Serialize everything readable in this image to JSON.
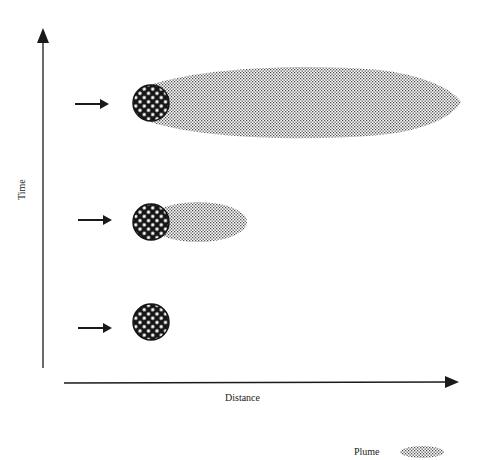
{
  "diagram": {
    "type": "plume-growth-over-time",
    "axes": {
      "y_label": "Time",
      "x_label": "Distance"
    },
    "rows": [
      {
        "level": "late",
        "arrow": "arrow-right",
        "source": "crosshatched-circle",
        "plume_extent": "long"
      },
      {
        "level": "middle",
        "arrow": "arrow-right",
        "source": "crosshatched-circle",
        "plume_extent": "short"
      },
      {
        "level": "early",
        "arrow": "arrow-right",
        "source": "crosshatched-circle",
        "plume_extent": "none"
      }
    ],
    "legend": {
      "items": [
        {
          "label": "Plume",
          "swatch": "stippled-ellipse"
        }
      ]
    },
    "colors": {
      "ink": "#1a1a1a",
      "plume_dot": "#5a5a5a",
      "background": "#ffffff"
    }
  }
}
